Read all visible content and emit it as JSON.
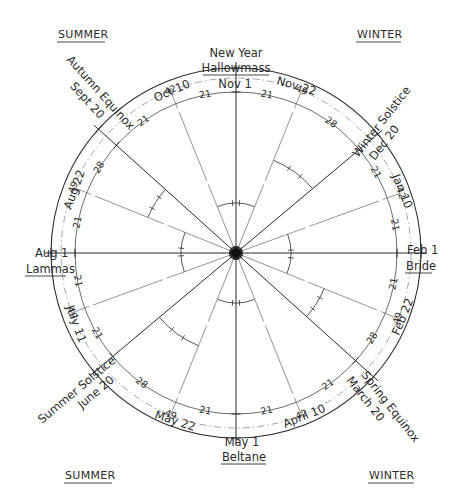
{
  "diagram": {
    "type": "wheel-of-the-year",
    "seasons": {
      "top_left": "SUMMER",
      "top_right": "WINTER",
      "bottom_left": "SUMMER",
      "bottom_right": "WINTER"
    },
    "cardinal_labels": {
      "top": {
        "line1": "New Year",
        "line2": "Hallowmass",
        "line3": "Nov 1"
      },
      "right": {
        "line1": "Feb 1",
        "line2": "Bride"
      },
      "bottom": {
        "line1": "May 1",
        "line2": "Beltane"
      },
      "left": {
        "line1": "Aug 1",
        "line2": "Lammas"
      }
    },
    "solstice_equinox_labels": {
      "winter_solstice": {
        "line1": "Winter Solstice",
        "line2": "Dec 20"
      },
      "spring_equinox": {
        "line1": "Spring Equinox",
        "line2": "March 20"
      },
      "summer_solstice": {
        "line1": "Summer Solstice",
        "line2": "June 20"
      },
      "autumn_equinox": {
        "line1": "Autumn Equinox",
        "line2": "Sept 20"
      }
    },
    "date_labels": {
      "nov22": "Nov 22",
      "jan10": "Jan 10",
      "feb22": "Feb 22",
      "apr10": "April 10",
      "may22": "May 22",
      "jul11": "July 11",
      "aug22": "Aug 22",
      "oct10": "Oct 10"
    },
    "outer_ring_numbers": {
      "nov_to_dec": "49",
      "dec_to_feb": "42",
      "feb_to_mar": "49",
      "mar_to_may": "42",
      "may_to_jun": "49",
      "jun_to_aug": "49",
      "aug_to_sep": "49",
      "sep_to_nov": "42"
    },
    "inner_ring_numbers": {
      "nov_a": "21",
      "nov_b": "28",
      "dec_a": "21",
      "jan_b": "21",
      "feb_a": "21",
      "feb_b": "28",
      "mar_a": "21",
      "apr_b": "21",
      "may_a": "21",
      "may_b": "28",
      "jun_a": "21",
      "jul_b": "21",
      "aug_a": "21",
      "aug_b": "28",
      "sep_a": "21",
      "oct_b": "21"
    },
    "colors": {
      "ink": "#2b2b2b",
      "paper": "#ffffff",
      "faint": "#9a9a9a"
    }
  }
}
